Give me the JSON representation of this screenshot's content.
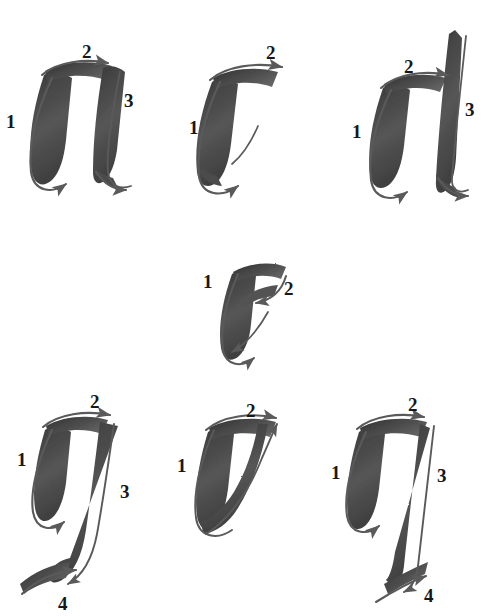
{
  "page": {
    "background_color": "#ffffff",
    "ink_color": "#4a4a4a",
    "ink_dark_color": "#2e2e2e",
    "arrow_color": "#5a5a5a",
    "numeral_color": "#171717",
    "width": 502,
    "height": 616
  },
  "letters": [
    {
      "id": "letter-a",
      "glyph": "a",
      "stroke_count": 4,
      "row": 1,
      "column": 1,
      "numerals": [
        {
          "label": "1",
          "x": 6,
          "y": 112
        },
        {
          "label": "2",
          "x": 82,
          "y": 42
        },
        {
          "label": "3",
          "x": 124,
          "y": 91
        }
      ]
    },
    {
      "id": "letter-c",
      "glyph": "c",
      "stroke_count": 2,
      "row": 1,
      "column": 2,
      "numerals": [
        {
          "label": "1",
          "x": 189,
          "y": 118
        },
        {
          "label": "2",
          "x": 266,
          "y": 43
        }
      ]
    },
    {
      "id": "letter-d",
      "glyph": "d",
      "stroke_count": 3,
      "row": 1,
      "column": 3,
      "numerals": [
        {
          "label": "1",
          "x": 352,
          "y": 122
        },
        {
          "label": "2",
          "x": 404,
          "y": 57
        },
        {
          "label": "3",
          "x": 465,
          "y": 100
        }
      ]
    },
    {
      "id": "letter-e",
      "glyph": "e",
      "stroke_count": 2,
      "row": 2,
      "column": 2,
      "numerals": [
        {
          "label": "1",
          "x": 203,
          "y": 272
        },
        {
          "label": "2",
          "x": 284,
          "y": 279
        }
      ]
    },
    {
      "id": "letter-g",
      "glyph": "g",
      "stroke_count": 4,
      "row": 3,
      "column": 1,
      "numerals": [
        {
          "label": "1",
          "x": 17,
          "y": 450
        },
        {
          "label": "2",
          "x": 90,
          "y": 392
        },
        {
          "label": "3",
          "x": 120,
          "y": 482
        },
        {
          "label": "4",
          "x": 58,
          "y": 594
        }
      ]
    },
    {
      "id": "letter-o",
      "glyph": "o",
      "stroke_count": 2,
      "row": 3,
      "column": 2,
      "numerals": [
        {
          "label": "1",
          "x": 177,
          "y": 456
        },
        {
          "label": "2",
          "x": 246,
          "y": 401
        }
      ]
    },
    {
      "id": "letter-q",
      "glyph": "q",
      "stroke_count": 4,
      "row": 3,
      "column": 3,
      "numerals": [
        {
          "label": "1",
          "x": 331,
          "y": 463
        },
        {
          "label": "2",
          "x": 408,
          "y": 395
        },
        {
          "label": "3",
          "x": 437,
          "y": 466
        },
        {
          "label": "4",
          "x": 424,
          "y": 586
        }
      ]
    }
  ]
}
